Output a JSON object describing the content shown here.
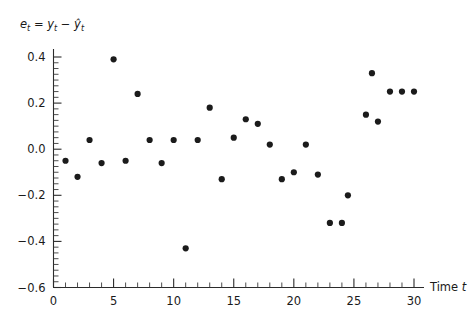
{
  "chart_data": {
    "type": "scatter",
    "title": "",
    "subtitle": "",
    "ylabel": "e_t = y_t - ŷ_t",
    "ylabel_parts": {
      "e": "e",
      "sub1": "t",
      "eq": "=",
      "y": "y",
      "sub2": "t",
      "minus": "−",
      "yhat": "ŷ",
      "sub3": "t"
    },
    "xlabel": "Time t",
    "xlabel_parts": {
      "word": "Time",
      "symbol": "t"
    },
    "xlim": [
      0,
      30.6
    ],
    "ylim": [
      -0.6,
      0.45
    ],
    "x_ticks": [
      0,
      5,
      10,
      15,
      20,
      25,
      30
    ],
    "x_tick_labels": [
      "0",
      "5",
      "10",
      "15",
      "20",
      "25",
      "30"
    ],
    "x_minor_step": 1,
    "y_ticks": [
      -0.6,
      -0.4,
      -0.2,
      0.0,
      0.2,
      0.4
    ],
    "y_tick_labels": [
      "−0.6",
      "−0.4",
      "−0.2",
      "0.0",
      "0.2",
      "0.4"
    ],
    "y_minor_step": 0.025,
    "grid": false,
    "legend": null,
    "marker": {
      "shape": "circle",
      "size_px": 3.1,
      "color": "#1b1b1b"
    },
    "x": [
      1,
      2,
      3,
      4,
      5,
      6,
      7,
      8,
      9,
      10,
      11,
      12,
      13,
      14,
      15,
      16,
      17,
      18,
      19,
      20,
      21,
      22,
      23,
      24,
      24.5,
      26,
      26.5,
      27,
      28,
      29,
      30
    ],
    "y": [
      -0.05,
      -0.12,
      0.04,
      -0.06,
      0.39,
      -0.05,
      0.24,
      0.04,
      -0.06,
      0.04,
      -0.43,
      0.04,
      0.18,
      -0.13,
      0.05,
      0.13,
      0.11,
      0.02,
      -0.13,
      -0.1,
      0.02,
      -0.11,
      -0.32,
      -0.32,
      -0.2,
      0.15,
      0.33,
      0.12,
      0.25,
      0.25,
      0.25
    ],
    "points": [
      {
        "t": 1,
        "e": -0.05
      },
      {
        "t": 2,
        "e": -0.12
      },
      {
        "t": 3,
        "e": 0.04
      },
      {
        "t": 4,
        "e": -0.06
      },
      {
        "t": 5,
        "e": 0.39
      },
      {
        "t": 6,
        "e": -0.05
      },
      {
        "t": 7,
        "e": 0.24
      },
      {
        "t": 8,
        "e": 0.04
      },
      {
        "t": 9,
        "e": -0.06
      },
      {
        "t": 10,
        "e": 0.04
      },
      {
        "t": 11,
        "e": -0.43
      },
      {
        "t": 12,
        "e": 0.04
      },
      {
        "t": 13,
        "e": 0.18
      },
      {
        "t": 14,
        "e": -0.13
      },
      {
        "t": 15,
        "e": 0.05
      },
      {
        "t": 16,
        "e": 0.13
      },
      {
        "t": 17,
        "e": 0.11
      },
      {
        "t": 18,
        "e": 0.02
      },
      {
        "t": 19,
        "e": -0.13
      },
      {
        "t": 20,
        "e": -0.1
      },
      {
        "t": 21,
        "e": 0.02
      },
      {
        "t": 22,
        "e": -0.11
      },
      {
        "t": 23,
        "e": -0.32
      },
      {
        "t": 24,
        "e": -0.32
      },
      {
        "t": 24.5,
        "e": -0.2
      },
      {
        "t": 26,
        "e": 0.15
      },
      {
        "t": 26.5,
        "e": 0.33
      },
      {
        "t": 27,
        "e": 0.12
      },
      {
        "t": 28,
        "e": 0.25
      },
      {
        "t": 29,
        "e": 0.25
      },
      {
        "t": 30,
        "e": 0.25
      }
    ]
  },
  "colors": {
    "background": "#ffffff",
    "axis": "#2b2b2b",
    "marker": "#1b1b1b",
    "text": "#1a1a1a"
  }
}
